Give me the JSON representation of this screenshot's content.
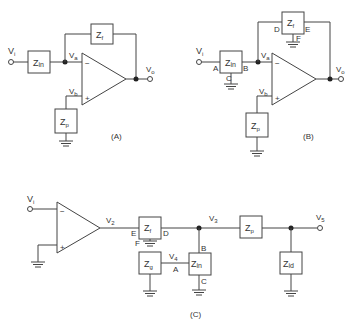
{
  "diagram_a": {
    "caption": "(A)",
    "input": "V",
    "input_sub": "i",
    "output": "V",
    "output_sub": "o",
    "node_a": "V",
    "node_a_sub": "a",
    "node_b": "V",
    "node_b_sub": "b",
    "zin": "Z",
    "zin_sub": "in",
    "zf": "Z",
    "zf_sub": "f",
    "zp": "Z",
    "zp_sub": "p",
    "minus": "−",
    "plus": "+"
  },
  "diagram_b": {
    "caption": "(B)",
    "input": "V",
    "input_sub": "i",
    "output": "V",
    "output_sub": "o",
    "node_a": "V",
    "node_a_sub": "a",
    "node_b": "V",
    "node_b_sub": "b",
    "zin": "Z",
    "zin_sub": "in",
    "zf": "Z",
    "zf_sub": "f",
    "zp": "Z",
    "zp_sub": "p",
    "pins": {
      "A": "A",
      "B": "B",
      "C": "C",
      "D": "D",
      "E": "E",
      "F": "F"
    },
    "minus": "−",
    "plus": "+"
  },
  "diagram_c": {
    "caption": "(C)",
    "input": "V",
    "input_sub": "i",
    "v2": "V",
    "v2_sub": "2",
    "v3": "V",
    "v3_sub": "3",
    "v4": "V",
    "v4_sub": "4",
    "v5": "V",
    "v5_sub": "5",
    "zf": "Z",
    "zf_sub": "f",
    "zg": "Z",
    "zg_sub": "g",
    "zin": "Z",
    "zin_sub": "in",
    "zp": "Z",
    "zp_sub": "p",
    "zid": "Z",
    "zid_sub": "id",
    "pins": {
      "A": "A",
      "B": "B",
      "C": "C",
      "D": "D",
      "E": "E",
      "F": "F"
    },
    "minus": "−",
    "plus": "+"
  }
}
